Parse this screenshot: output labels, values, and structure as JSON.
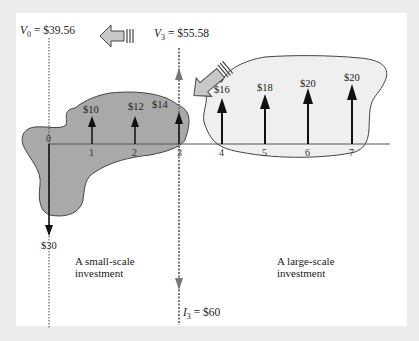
{
  "figure": {
    "labels": {
      "v0": {
        "symbol": "V",
        "subscript": "0",
        "value": "= $39.56"
      },
      "v3": {
        "symbol": "V",
        "subscript": "3",
        "value": "= $55.58"
      },
      "i3": {
        "symbol": "I",
        "subscript": "3",
        "value": "= $60"
      }
    },
    "small_scale": {
      "caption_line1": "A small-scale",
      "caption_line2": "investment",
      "initial_outflow": "$30",
      "cash_flows": [
        "$10",
        "$12",
        "$14"
      ]
    },
    "large_scale": {
      "caption_line1": "A large-scale",
      "caption_line2": "investment",
      "cash_flows": [
        "$16",
        "$18",
        "$20",
        "$20"
      ]
    },
    "periods": [
      "0",
      "1",
      "2",
      "3",
      "4",
      "5",
      "6",
      "7"
    ],
    "colors": {
      "small_blob_fill": "#a9a9a9",
      "large_blob_fill": "#efefef",
      "arrow_fill": "#c8c8c8",
      "background": "#ececec",
      "panel": "#ffffff"
    },
    "icons": [
      "left-block-arrow-icon",
      "up-left-block-arrow-icon"
    ]
  }
}
